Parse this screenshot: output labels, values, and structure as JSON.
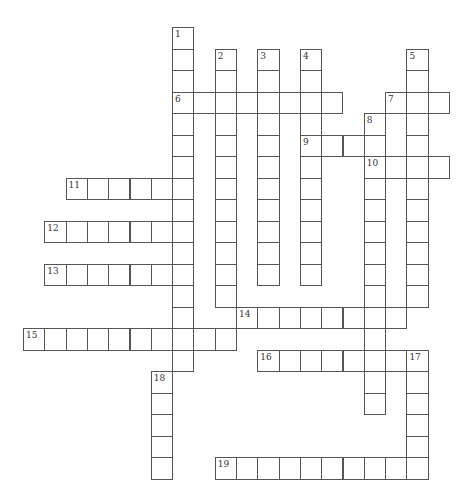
{
  "puzzle": {
    "type": "crossword",
    "grid_origin": {
      "x": 23,
      "y": 27
    },
    "cell_size": {
      "w": 21.3,
      "h": 21.5
    },
    "colors": {
      "border": "#555555",
      "background": "#ffffff",
      "number": "#333333"
    },
    "words": [
      {
        "number": "1",
        "dir": "down",
        "row": 0,
        "col": 7,
        "length": 16
      },
      {
        "number": "2",
        "dir": "down",
        "row": 1,
        "col": 9,
        "length": 12
      },
      {
        "number": "3",
        "dir": "down",
        "row": 1,
        "col": 11,
        "length": 11
      },
      {
        "number": "4",
        "dir": "down",
        "row": 1,
        "col": 13,
        "length": 11
      },
      {
        "number": "5",
        "dir": "down",
        "row": 1,
        "col": 18,
        "length": 12
      },
      {
        "number": "6",
        "dir": "across",
        "row": 3,
        "col": 7,
        "length": 8
      },
      {
        "number": "7",
        "dir": "across",
        "row": 3,
        "col": 17,
        "length": 3
      },
      {
        "number": "8",
        "dir": "down",
        "row": 4,
        "col": 16,
        "length": 14
      },
      {
        "number": "9",
        "dir": "across",
        "row": 5,
        "col": 13,
        "length": 4
      },
      {
        "number": "10",
        "dir": "across",
        "row": 6,
        "col": 16,
        "length": 4
      },
      {
        "number": "11",
        "dir": "across",
        "row": 7,
        "col": 2,
        "length": 6
      },
      {
        "number": "12",
        "dir": "across",
        "row": 9,
        "col": 1,
        "length": 7
      },
      {
        "number": "13",
        "dir": "across",
        "row": 11,
        "col": 1,
        "length": 7
      },
      {
        "number": "14",
        "dir": "across",
        "row": 13,
        "col": 10,
        "length": 8
      },
      {
        "number": "15",
        "dir": "across",
        "row": 14,
        "col": 0,
        "length": 10
      },
      {
        "number": "16",
        "dir": "across",
        "row": 15,
        "col": 11,
        "length": 8
      },
      {
        "number": "17",
        "dir": "down",
        "row": 15,
        "col": 18,
        "length": 6
      },
      {
        "number": "18",
        "dir": "down",
        "row": 16,
        "col": 6,
        "length": 5
      },
      {
        "number": "19",
        "dir": "across",
        "row": 20,
        "col": 9,
        "length": 10
      }
    ],
    "extra_cells": [
      {
        "row": 12,
        "col": 10
      },
      {
        "row": 12,
        "col": 11
      },
      {
        "row": 12,
        "col": 12
      },
      {
        "row": 12,
        "col": 13
      },
      {
        "row": 12,
        "col": 14
      },
      {
        "row": 12,
        "col": 15
      },
      {
        "row": 12,
        "col": 17
      }
    ]
  }
}
